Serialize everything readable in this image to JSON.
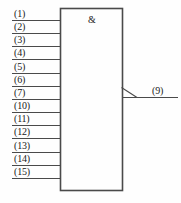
{
  "diagram": {
    "kind": "logic-gate-schematic",
    "gate_symbol": "&",
    "gate_function": "AND",
    "notation": "IEC rectangular",
    "line_color": "#4a4a4a",
    "text_color": "#1a1a1a",
    "background_color": "#fefefe",
    "body": {
      "x": 60,
      "y": 8,
      "width": 62,
      "height": 182
    },
    "inputs": [
      {
        "label": "(1)",
        "y": 20
      },
      {
        "label": "(2)",
        "y": 33
      },
      {
        "label": "(3)",
        "y": 46
      },
      {
        "label": "(4)",
        "y": 59
      },
      {
        "label": "(5)",
        "y": 73
      },
      {
        "label": "(6)",
        "y": 86
      },
      {
        "label": "(7)",
        "y": 99
      },
      {
        "label": "(10)",
        "y": 112
      },
      {
        "label": "(11)",
        "y": 125
      },
      {
        "label": "(12)",
        "y": 138
      },
      {
        "label": "(13)",
        "y": 152
      },
      {
        "label": "(14)",
        "y": 165
      },
      {
        "label": "(15)",
        "y": 178
      }
    ],
    "input_count": 13,
    "outputs": [
      {
        "label": "(9)",
        "y": 97,
        "marker": "slash"
      }
    ],
    "output_count": 1
  }
}
